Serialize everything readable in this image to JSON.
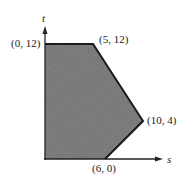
{
  "diagram": {
    "type": "feasible-region",
    "axes": {
      "x_label": "s",
      "y_label": "t"
    },
    "vertices": [
      {
        "label": "(0, 12)",
        "s": 0,
        "t": 12
      },
      {
        "label": "(5, 12)",
        "s": 5,
        "t": 12
      },
      {
        "label": "(10, 4)",
        "s": 10,
        "t": 4
      },
      {
        "label": "(6, 0)",
        "s": 6,
        "t": 0
      }
    ],
    "polygon": [
      [
        0,
        0
      ],
      [
        0,
        12
      ],
      [
        5,
        12
      ],
      [
        10,
        4
      ],
      [
        6,
        0
      ]
    ],
    "fill_color": "#6e6e6e",
    "edge_color": "#1a1a1a"
  }
}
